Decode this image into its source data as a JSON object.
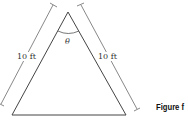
{
  "diagram": {
    "left_side_label": "10 ft",
    "right_side_label": "10 ft",
    "angle_label": "θ",
    "figure_caption": "Figure f"
  }
}
